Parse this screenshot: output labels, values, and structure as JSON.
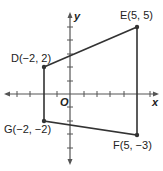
{
  "figure": {
    "axes": {
      "x_label": "x",
      "y_label": "y",
      "origin_label": "O",
      "x_range": [
        -4,
        6
      ],
      "y_range": [
        -5,
        5
      ]
    },
    "points": [
      {
        "name": "D",
        "x": -2,
        "y": 2,
        "label": "D(−2, 2)"
      },
      {
        "name": "E",
        "x": 5,
        "y": 5,
        "label": "E(5, 5)"
      },
      {
        "name": "F",
        "x": 5,
        "y": -3,
        "label": "F(5, −3)"
      },
      {
        "name": "G",
        "x": -2,
        "y": -2,
        "label": "G(−2, −2)"
      }
    ],
    "polygon": [
      "D",
      "E",
      "F",
      "G"
    ],
    "colors": {
      "line": "#333333",
      "axis": "#555555"
    }
  }
}
